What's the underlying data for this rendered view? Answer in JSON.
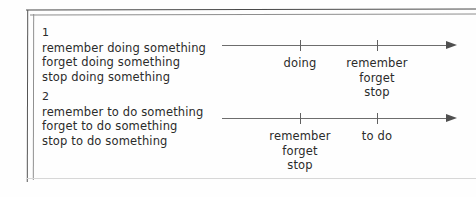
{
  "diagram": {
    "title_hidden": "",
    "sections": [
      {
        "number": "1",
        "lines": [
          "remember doing something",
          "forget doing something",
          "stop doing something"
        ],
        "timeline": {
          "arrow_direction": "right",
          "ticks": [
            {
              "label_lines": [
                "doing"
              ]
            },
            {
              "label_lines": [
                "remember",
                "forget",
                "stop"
              ]
            }
          ]
        }
      },
      {
        "number": "2",
        "lines": [
          "remember to do something",
          "forget to do something",
          "stop to do something"
        ],
        "timeline": {
          "arrow_direction": "right",
          "ticks": [
            {
              "label_lines": [
                "remember",
                "forget",
                "stop"
              ]
            },
            {
              "label_lines": [
                "to do"
              ]
            }
          ]
        }
      }
    ]
  },
  "colors": {
    "ink": "#2b2b2b",
    "axis": "#6d6d6d",
    "frame": "#4a4a4a",
    "background": "#fefefe"
  }
}
